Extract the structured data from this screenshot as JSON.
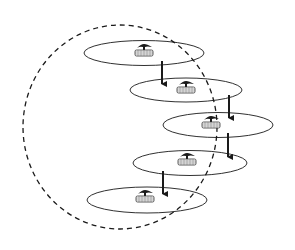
{
  "diagram": {
    "width": 295,
    "height": 250,
    "background": "#ffffff",
    "stroke_color": "#1a1a1a",
    "boundary": {
      "shape": "dashed-ellipse",
      "cx": 120,
      "cy": 127,
      "rx": 97,
      "ry": 102
    },
    "cells": [
      {
        "id": 1,
        "cx": 144,
        "cy": 53,
        "rx": 60,
        "ry": 12.5,
        "icon": "base-station-icon",
        "icon_x": 144,
        "icon_y": 50
      },
      {
        "id": 2,
        "cx": 186,
        "cy": 90,
        "rx": 56,
        "ry": 12,
        "icon": "base-station-icon",
        "icon_x": 186,
        "icon_y": 87
      },
      {
        "id": 3,
        "cx": 218,
        "cy": 125,
        "rx": 55,
        "ry": 12.5,
        "icon": "base-station-icon",
        "icon_x": 211,
        "icon_y": 122
      },
      {
        "id": 4,
        "cx": 190,
        "cy": 163,
        "rx": 57,
        "ry": 12.5,
        "icon": "base-station-icon",
        "icon_x": 187,
        "icon_y": 159
      },
      {
        "id": 5,
        "cx": 147,
        "cy": 200,
        "rx": 60,
        "ry": 13,
        "icon": "base-station-icon",
        "icon_x": 145,
        "icon_y": 196
      }
    ],
    "arrows": [
      {
        "from": 1,
        "to": 2,
        "x": 162,
        "y1": 61,
        "y2": 84
      },
      {
        "from": 2,
        "to": 3,
        "x": 229,
        "y1": 95,
        "y2": 118
      },
      {
        "from": 3,
        "to": 4,
        "x": 228,
        "y1": 133,
        "y2": 157
      },
      {
        "from": 4,
        "to": 5,
        "x": 163,
        "y1": 171,
        "y2": 194
      }
    ]
  }
}
